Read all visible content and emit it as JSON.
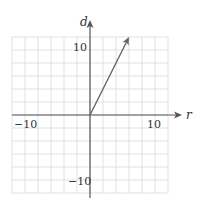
{
  "chart_data": {
    "type": "line",
    "title": "",
    "xlabel": "r",
    "ylabel": "d",
    "xlim": [
      -12,
      12
    ],
    "ylim": [
      -12,
      12
    ],
    "grid": true,
    "grid_step": 2,
    "x_tick_labels": [
      "-10",
      "10"
    ],
    "y_tick_labels": [
      "10",
      "-10"
    ],
    "series": [
      {
        "name": "vector",
        "kind": "arrow",
        "x": [
          0,
          6
        ],
        "y": [
          0,
          12
        ]
      }
    ]
  },
  "labels": {
    "x_axis": "r",
    "y_axis": "d",
    "x_neg": "−10",
    "x_pos": "10",
    "y_pos": "10",
    "y_neg": "−10"
  },
  "colors": {
    "grid": "#d9d9d9",
    "axis": "#555555",
    "vector": "#666666"
  }
}
